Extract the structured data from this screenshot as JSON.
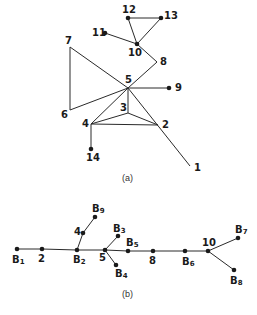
{
  "figure_a": {
    "caption": "(a)",
    "nodes": [
      {
        "id": "1",
        "label": "1",
        "x": 190,
        "y": 166,
        "dot": false,
        "lx": 194,
        "ly": 171
      },
      {
        "id": "2",
        "label": "2",
        "x": 158,
        "y": 125,
        "dot": false,
        "lx": 162,
        "ly": 128
      },
      {
        "id": "3",
        "label": "3",
        "x": 128,
        "y": 113,
        "dot": false,
        "lx": 120,
        "ly": 111
      },
      {
        "id": "4",
        "label": "4",
        "x": 91,
        "y": 124,
        "dot": false,
        "lx": 82,
        "ly": 127
      },
      {
        "id": "5",
        "label": "5",
        "x": 128,
        "y": 88,
        "dot": false,
        "lx": 125,
        "ly": 83
      },
      {
        "id": "6",
        "label": "6",
        "x": 70,
        "y": 110,
        "dot": false,
        "lx": 61,
        "ly": 118
      },
      {
        "id": "7",
        "label": "7",
        "x": 70,
        "y": 47,
        "dot": false,
        "lx": 65,
        "ly": 44
      },
      {
        "id": "8",
        "label": "8",
        "x": 157,
        "y": 62,
        "dot": false,
        "lx": 160,
        "ly": 65
      },
      {
        "id": "9",
        "label": "9",
        "x": 169,
        "y": 88,
        "dot": true,
        "lx": 175,
        "ly": 91
      },
      {
        "id": "10",
        "label": "10",
        "x": 137,
        "y": 44,
        "dot": true,
        "lx": 128,
        "ly": 56
      },
      {
        "id": "11",
        "label": "11",
        "x": 105,
        "y": 33,
        "dot": true,
        "lx": 92,
        "ly": 36
      },
      {
        "id": "12",
        "label": "12",
        "x": 128,
        "y": 18,
        "dot": true,
        "lx": 122,
        "ly": 13
      },
      {
        "id": "13",
        "label": "13",
        "x": 161,
        "y": 18,
        "dot": true,
        "lx": 164,
        "ly": 19
      },
      {
        "id": "14",
        "label": "14",
        "x": 91,
        "y": 149,
        "dot": true,
        "lx": 86,
        "ly": 161
      }
    ],
    "edges": [
      [
        "7",
        "6"
      ],
      [
        "7",
        "5"
      ],
      [
        "6",
        "5"
      ],
      [
        "5",
        "8"
      ],
      [
        "8",
        "10"
      ],
      [
        "10",
        "11"
      ],
      [
        "10",
        "12"
      ],
      [
        "10",
        "13"
      ],
      [
        "12",
        "13"
      ],
      [
        "5",
        "9"
      ],
      [
        "5",
        "3"
      ],
      [
        "5",
        "4"
      ],
      [
        "5",
        "1"
      ],
      [
        "3",
        "4"
      ],
      [
        "3",
        "2"
      ],
      [
        "4",
        "2"
      ],
      [
        "4",
        "14"
      ]
    ]
  },
  "figure_b": {
    "caption": "(b)",
    "nodes": [
      {
        "id": "B1",
        "label": "B",
        "sub": "1",
        "x": 17,
        "y": 249,
        "lx": 12,
        "ly": 263
      },
      {
        "id": "2",
        "label": "2",
        "sub": "",
        "x": 42,
        "y": 249,
        "lx": 38,
        "ly": 262
      },
      {
        "id": "B2",
        "label": "B",
        "sub": "2",
        "x": 77,
        "y": 250,
        "lx": 73,
        "ly": 263
      },
      {
        "id": "4",
        "label": "4",
        "sub": "",
        "x": 83,
        "y": 233,
        "lx": 74,
        "ly": 235
      },
      {
        "id": "B9",
        "label": "B",
        "sub": "9",
        "x": 95,
        "y": 217,
        "lx": 92,
        "ly": 212
      },
      {
        "id": "5",
        "label": "5",
        "sub": "",
        "x": 105,
        "y": 250,
        "lx": 99,
        "ly": 261
      },
      {
        "id": "B3",
        "label": "B",
        "sub": "3",
        "x": 118,
        "y": 236,
        "lx": 113,
        "ly": 232
      },
      {
        "id": "B4",
        "label": "B",
        "sub": "4",
        "x": 116,
        "y": 265,
        "lx": 115,
        "ly": 277
      },
      {
        "id": "B5",
        "label": "B",
        "sub": "5",
        "x": 128,
        "y": 251,
        "lx": 126,
        "ly": 246
      },
      {
        "id": "8",
        "label": "8",
        "sub": "",
        "x": 153,
        "y": 251,
        "lx": 149,
        "ly": 264
      },
      {
        "id": "B6",
        "label": "B",
        "sub": "6",
        "x": 185,
        "y": 251,
        "lx": 182,
        "ly": 265
      },
      {
        "id": "10",
        "label": "10",
        "sub": "",
        "x": 208,
        "y": 251,
        "lx": 202,
        "ly": 246
      },
      {
        "id": "B7",
        "label": "B",
        "sub": "7",
        "x": 238,
        "y": 238,
        "lx": 235,
        "ly": 233
      },
      {
        "id": "B8",
        "label": "B",
        "sub": "8",
        "x": 234,
        "y": 270,
        "lx": 230,
        "ly": 284
      }
    ],
    "edges": [
      [
        "B1",
        "2"
      ],
      [
        "2",
        "B2"
      ],
      [
        "B2",
        "4"
      ],
      [
        "4",
        "B9"
      ],
      [
        "B2",
        "5"
      ],
      [
        "5",
        "B3"
      ],
      [
        "5",
        "B4"
      ],
      [
        "5",
        "B5"
      ],
      [
        "B5",
        "8"
      ],
      [
        "8",
        "B6"
      ],
      [
        "B6",
        "10"
      ],
      [
        "10",
        "B7"
      ],
      [
        "10",
        "B8"
      ]
    ]
  }
}
